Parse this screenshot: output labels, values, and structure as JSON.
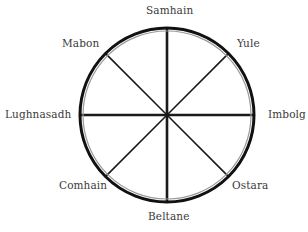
{
  "diagram": {
    "colors": {
      "ring": "#111111",
      "spoke": "#1a1a1a",
      "inner_ring": "#8a8a8a",
      "text": "#3a3a3a"
    },
    "labels": {
      "top": "Samhain",
      "top_right": "Yule",
      "right": "Imbolg",
      "bottom_right": "Ostara",
      "bottom": "Beltane",
      "bottom_left": "Comhain",
      "left": "Lughnasadh",
      "top_left": "Mabon"
    },
    "spokes": 8
  }
}
